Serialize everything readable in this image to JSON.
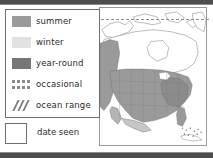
{
  "figure": {
    "kind": "map-legend-figure"
  },
  "legend": {
    "items": [
      {
        "id": "summer",
        "label": "summer",
        "swatch": "solid-swatch",
        "color": "#9a9a9a"
      },
      {
        "id": "winter",
        "label": "winter",
        "swatch": "solid-swatch",
        "color": "#e2e2e2"
      },
      {
        "id": "year-round",
        "label": "year-round",
        "swatch": "solid-swatch",
        "color": "#767676"
      },
      {
        "id": "occasional",
        "label": "occasional",
        "swatch": "dotted-swatch",
        "color": "#8a8a8a"
      },
      {
        "id": "ocean-range",
        "label": "ocean range",
        "swatch": "hatched-swatch",
        "color": "#7d7d7d"
      }
    ]
  },
  "date_seen": {
    "label": "date seen",
    "value": "",
    "placeholder": ""
  },
  "map": {
    "region": "North America",
    "fill_shaded": "#9a9a9a",
    "fill_light": "#d8d8d8",
    "outline": "#6a6a6a",
    "background": "#ffffff"
  },
  "chrome": {
    "rail_color": "#4e4e4e"
  }
}
